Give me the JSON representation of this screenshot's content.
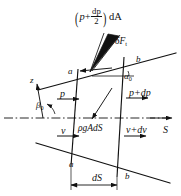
{
  "figure": {
    "background_color": "#ffffff",
    "stroke_color": "#111111"
  },
  "labels": {
    "pressure_force_top_prefix": "(",
    "pressure_force_top_p": "p",
    "pressure_force_top_plus": "+",
    "pressure_force_top_num": "dp",
    "pressure_force_top_den": "2",
    "pressure_force_top_suffix": ")",
    "pressure_force_top_dA": "dA",
    "side_force_symbol": "δF",
    "side_force_subscript": "t",
    "corner_a_top": "a",
    "corner_b_top": "b",
    "angle_alpha": "α",
    "angle_alpha_subscript": "0",
    "axis_z": "z",
    "angle_beta": "β",
    "angle_beta_subscript": "0",
    "pressure_in": "p",
    "pressure_out": "p+dp",
    "velocity_in": "v",
    "weight_term": "ρgAdS",
    "velocity_out": "v+dv",
    "axis_S": "S",
    "corner_a_bottom": "a",
    "corner_b_bottom": "b",
    "length_dS": "dS"
  },
  "geometry": {
    "left_wall_x_top": 78,
    "left_wall_x_bottom": 71,
    "right_wall_x_top": 124,
    "right_wall_x_bottom": 117,
    "centerline_y": 118,
    "top_face_slope": "down-left",
    "bottom_face_slope": "down-right"
  }
}
